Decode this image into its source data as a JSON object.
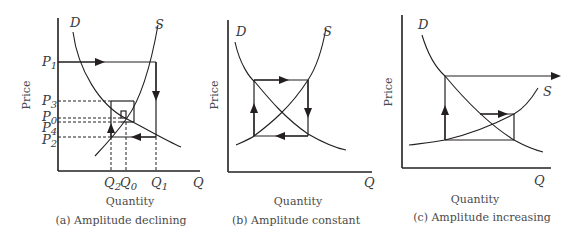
{
  "panels": [
    {
      "id": "a",
      "caption": "(a) Amplitude declining",
      "x_label": "Quantity",
      "y_label": "Price",
      "x_axis_symbol": "Q",
      "demand_label": "D",
      "supply_label": "S",
      "price_labels": {
        "p1": "P",
        "p1_sub": "1",
        "p3": "P",
        "p3_sub": "3",
        "p0": "P",
        "p0_sub": "0",
        "p4": "P",
        "p4_sub": "4",
        "p2": "P",
        "p2_sub": "2"
      },
      "quantity_labels": {
        "q2": "Q",
        "q2_sub": "2",
        "q0": "Q",
        "q0_sub": "0",
        "q1": "Q",
        "q1_sub": "1"
      }
    },
    {
      "id": "b",
      "caption": "(b) Amplitude constant",
      "x_label": "Quantity",
      "y_label": "Price",
      "x_axis_symbol": "Q",
      "demand_label": "D",
      "supply_label": "S"
    },
    {
      "id": "c",
      "caption": "(c) Amplitude increasing",
      "x_label": "Quantity",
      "y_label": "Price",
      "x_axis_symbol": "Q",
      "demand_label": "D",
      "supply_label": "S"
    }
  ]
}
